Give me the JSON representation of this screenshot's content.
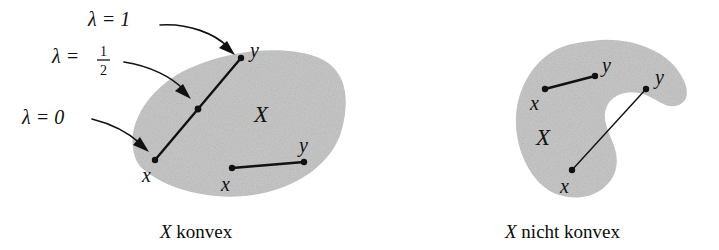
{
  "figure": {
    "fill_color": "#c9c9c9",
    "ink_color": "#111111",
    "background": "#ffffff"
  },
  "left_panel": {
    "caption_symbol": "X",
    "caption_text": "konvex",
    "set_label": "X",
    "annotations": [
      {
        "id": "lambda-one",
        "text": "λ = 1",
        "lambda_value": "1",
        "points_to": "y-upper"
      },
      {
        "id": "lambda-half",
        "text": "λ =",
        "lambda_value": "1/2",
        "numerator": "1",
        "denominator": "2",
        "points_to": "midpoint"
      },
      {
        "id": "lambda-zero",
        "text": "λ = 0",
        "lambda_value": "0",
        "points_to": "x-lower-left"
      }
    ],
    "segments": [
      {
        "id": "segment-main",
        "from_label": "x",
        "to_label": "y",
        "has_midpoint_dot": true,
        "endpoints_inside_set": true
      },
      {
        "id": "segment-secondary",
        "from_label": "x",
        "to_label": "y",
        "has_midpoint_dot": false,
        "endpoints_inside_set": true
      }
    ]
  },
  "right_panel": {
    "caption_symbol": "X",
    "caption_text": "nicht konvex",
    "set_label": "X",
    "segments": [
      {
        "id": "segment-inside",
        "from_label": "x",
        "to_label": "y",
        "lies_inside_set": true
      },
      {
        "id": "segment-outside",
        "from_label": "x",
        "to_label": "y",
        "lies_inside_set": false
      }
    ]
  }
}
